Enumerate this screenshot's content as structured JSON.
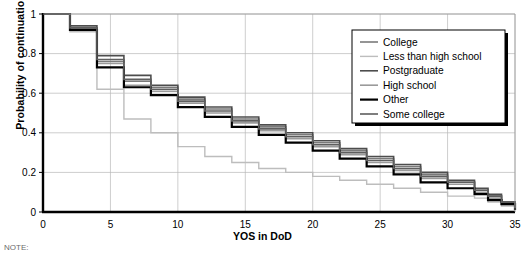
{
  "axes": {
    "ylabel": "Probability of continuation",
    "xlabel": "YOS in DoD",
    "yticks": [
      "0",
      "0.2",
      "0.4",
      "0.6",
      "0.8",
      "1"
    ],
    "xticks": [
      "0",
      "5",
      "10",
      "15",
      "20",
      "25",
      "30",
      "35"
    ]
  },
  "note": {
    "text": "NOTE: "
  },
  "legend": {
    "items": [
      {
        "label": "College",
        "color": "#7a7a7a",
        "width": 1.6
      },
      {
        "label": "Less than high school",
        "color": "#bdbdbd",
        "width": 1.4
      },
      {
        "label": "Postgraduate",
        "color": "#4d4d4d",
        "width": 1.6
      },
      {
        "label": "High school",
        "color": "#9a9a9a",
        "width": 1.6
      },
      {
        "label": "Other",
        "color": "#000000",
        "width": 2.2
      },
      {
        "label": "Some college",
        "color": "#5e5e5e",
        "width": 1.6
      }
    ]
  },
  "chart_data": {
    "type": "line",
    "title": "",
    "xlabel": "YOS in DoD",
    "ylabel": "Probability of continuation",
    "xlim": [
      0,
      35
    ],
    "ylim": [
      0,
      1
    ],
    "grid": true,
    "step": "post",
    "legend_position": "top-right",
    "x": [
      0,
      1,
      2,
      3,
      4,
      5,
      6,
      7,
      8,
      9,
      10,
      11,
      12,
      13,
      14,
      15,
      16,
      17,
      18,
      19,
      20,
      21,
      22,
      23,
      24,
      25,
      26,
      27,
      28,
      29,
      30,
      31,
      32,
      33,
      34,
      35
    ],
    "series": [
      {
        "name": "College",
        "values": [
          1,
          1,
          0.93,
          0.93,
          0.76,
          0.76,
          0.66,
          0.66,
          0.63,
          0.63,
          0.57,
          0.57,
          0.52,
          0.52,
          0.47,
          0.47,
          0.43,
          0.43,
          0.39,
          0.39,
          0.35,
          0.35,
          0.31,
          0.31,
          0.27,
          0.27,
          0.23,
          0.23,
          0.19,
          0.19,
          0.15,
          0.15,
          0.11,
          0.08,
          0.05,
          0.02
        ]
      },
      {
        "name": "Less than high school",
        "values": [
          1,
          1,
          0.91,
          0.91,
          0.62,
          0.62,
          0.47,
          0.47,
          0.4,
          0.4,
          0.33,
          0.33,
          0.28,
          0.28,
          0.25,
          0.25,
          0.22,
          0.22,
          0.2,
          0.2,
          0.18,
          0.18,
          0.16,
          0.16,
          0.14,
          0.14,
          0.12,
          0.12,
          0.1,
          0.1,
          0.08,
          0.08,
          0.07,
          0.05,
          0.03,
          0.01
        ]
      },
      {
        "name": "Postgraduate",
        "values": [
          1,
          1,
          0.94,
          0.94,
          0.79,
          0.79,
          0.69,
          0.69,
          0.64,
          0.64,
          0.58,
          0.58,
          0.53,
          0.53,
          0.48,
          0.48,
          0.44,
          0.44,
          0.4,
          0.4,
          0.36,
          0.36,
          0.32,
          0.32,
          0.28,
          0.28,
          0.24,
          0.24,
          0.2,
          0.2,
          0.16,
          0.16,
          0.12,
          0.09,
          0.05,
          0.02
        ]
      },
      {
        "name": "High school",
        "values": [
          1,
          1,
          0.92,
          0.92,
          0.75,
          0.75,
          0.64,
          0.64,
          0.61,
          0.61,
          0.55,
          0.55,
          0.5,
          0.5,
          0.45,
          0.45,
          0.41,
          0.41,
          0.37,
          0.37,
          0.33,
          0.33,
          0.29,
          0.29,
          0.25,
          0.25,
          0.21,
          0.21,
          0.17,
          0.17,
          0.14,
          0.14,
          0.1,
          0.07,
          0.04,
          0.02
        ]
      },
      {
        "name": "Other",
        "values": [
          1,
          1,
          0.92,
          0.92,
          0.73,
          0.73,
          0.63,
          0.63,
          0.59,
          0.59,
          0.53,
          0.53,
          0.48,
          0.48,
          0.43,
          0.43,
          0.39,
          0.39,
          0.35,
          0.35,
          0.31,
          0.31,
          0.27,
          0.27,
          0.23,
          0.23,
          0.19,
          0.19,
          0.15,
          0.15,
          0.12,
          0.12,
          0.09,
          0.06,
          0.04,
          0.01
        ]
      },
      {
        "name": "Some college",
        "values": [
          1,
          1,
          0.93,
          0.93,
          0.77,
          0.77,
          0.67,
          0.67,
          0.62,
          0.62,
          0.56,
          0.56,
          0.51,
          0.51,
          0.46,
          0.46,
          0.42,
          0.42,
          0.38,
          0.38,
          0.34,
          0.34,
          0.3,
          0.3,
          0.26,
          0.26,
          0.22,
          0.22,
          0.18,
          0.18,
          0.15,
          0.15,
          0.11,
          0.08,
          0.05,
          0.02
        ]
      }
    ]
  }
}
